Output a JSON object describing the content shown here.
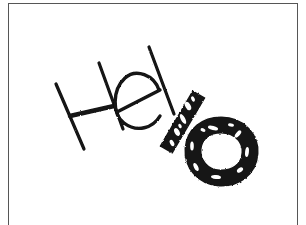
{
  "canvas": {
    "width": 306,
    "height": 225,
    "background_color": "#ffffff",
    "frame_color": "#565656",
    "ink_color": "#121212",
    "description": "Handwritten word drawn in black ink on a white sheet with a thin gray border"
  },
  "drawing": {
    "name": "handwritten-hello-sketch",
    "text_depicted": "Hello",
    "style": "hand-drawn marker lettering, slanted baseline, last two glyphs heavily inked",
    "glyphs": [
      {
        "char": "H",
        "name": "letter-h",
        "weight": "thin",
        "stroke_width": 3.2,
        "strokes": [
          {
            "name": "h-left-stem",
            "d": "M 56 84 L 84 149"
          },
          {
            "name": "h-right-stem",
            "d": "M 99 63 L 123 129"
          },
          {
            "name": "h-crossbar",
            "d": "M 70 116 L 114 106"
          }
        ]
      },
      {
        "char": "e",
        "name": "letter-e",
        "weight": "thin",
        "stroke_width": 3.2,
        "strokes": [
          {
            "name": "e-bowl",
            "d": "M 159 90 C 153 74 133 69 124 80 C 113 93 114 114 125 123 C 136 132 152 128 159 117"
          },
          {
            "name": "e-crossbar",
            "d": "M 117 112 L 159 91"
          }
        ]
      },
      {
        "char": "l",
        "name": "letter-l-thin",
        "weight": "thin",
        "stroke_width": 3.2,
        "strokes": [
          {
            "name": "l-thin-stem",
            "d": "M 149 47 L 174 114"
          }
        ]
      },
      {
        "char": "l",
        "name": "letter-l-thick",
        "weight": "heavy",
        "stroke_width": 14,
        "strokes": [
          {
            "name": "l-thick-stem",
            "d": "M 199 93 L 165 151"
          }
        ]
      },
      {
        "char": "o",
        "name": "letter-o-thick",
        "weight": "heavy",
        "stroke_width": 16,
        "strokes": [
          {
            "name": "o-ring",
            "d": "M 221 124 C 241 124 252 139 250 153 C 248 170 234 179 219 178 C 202 177 191 164 192 149 C 193 134 205 124 221 124 Z"
          }
        ]
      }
    ]
  },
  "frame": {
    "name": "page-border",
    "visible": true,
    "thickness_px": 1.5
  }
}
